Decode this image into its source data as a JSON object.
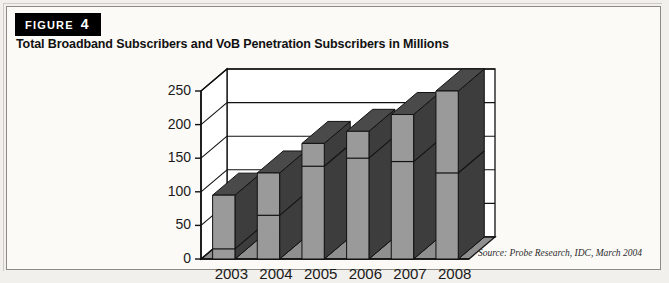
{
  "figure": {
    "badge_word": "FIGURE",
    "badge_number": "4",
    "title": "Total Broadband Subscribers and VoB Penetration Subscribers in Millions",
    "source": "Source: Probe Research, IDC, March 2004"
  },
  "colors": {
    "bar_front": "#9a9a9a",
    "bar_side": "#3d3d3d",
    "bar_top": "#4a4a4a",
    "floor": "#8f8f8f",
    "outline": "#111111",
    "plot_background": "#ffffff",
    "badge_background": "#000000",
    "badge_text": "#ffffff"
  },
  "chart_data": {
    "type": "bar",
    "title": "Total Broadband Subscribers and VoB Penetration Subscribers in Millions",
    "xlabel": "",
    "ylabel": "",
    "ylim": [
      0,
      250
    ],
    "yticks": [
      0,
      50,
      100,
      150,
      200,
      250
    ],
    "ytick_labels": [
      "0",
      "50",
      "100",
      "150",
      "200",
      "250"
    ],
    "categories": [
      "2003",
      "2004",
      "2005",
      "2006",
      "2007",
      "2008"
    ],
    "grid": true,
    "legend": "none",
    "three_d": true,
    "series": [
      {
        "name": "Total Broadband Subscribers",
        "values": [
          95,
          128,
          172,
          190,
          215,
          250
        ]
      },
      {
        "name": "VoB Penetration Subscribers",
        "values": [
          15,
          65,
          138,
          150,
          145,
          128
        ]
      }
    ]
  }
}
